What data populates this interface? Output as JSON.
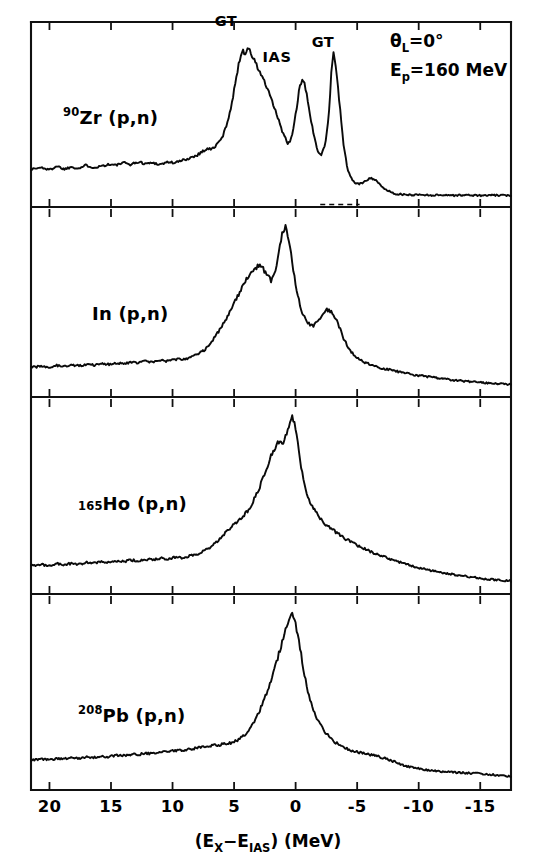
{
  "figure": {
    "kind": "multi-panel-spectrum",
    "background_color": "#ffffff",
    "ink_color": "#0a0a0a"
  },
  "axis": {
    "x_title_parts": {
      "open": "(E",
      "sub1": "X",
      "minus": "−E",
      "sub2": "IAS",
      "close": ") (MeV)"
    },
    "x_title_plain": "(E_X-E_IAS) (MeV)",
    "x_tick_labels": [
      "20",
      "15",
      "10",
      "5",
      "0",
      "-5",
      "-10",
      "-15"
    ],
    "x_tick_values": [
      20,
      15,
      10,
      5,
      0,
      -5,
      -10,
      -15
    ],
    "x_range": [
      21.5,
      -17.5
    ],
    "x_direction": "decreasing-left-to-right"
  },
  "conditions": {
    "angle_symbol": "θ",
    "angle_sub": "L",
    "angle_value": "=0°",
    "angle_full": "θ_L = 0°",
    "energy_symbol": "E",
    "energy_sub": "p",
    "energy_value": "=160 MeV",
    "energy_full": "E_p = 160 MeV"
  },
  "panels": [
    {
      "id": "zr90",
      "label_iso": "90",
      "label_text": "Zr (p,n)",
      "label_full": "90Zr (p,n)",
      "peak_labels": [
        {
          "text": "GT",
          "x_mev": 4.8
        },
        {
          "text": "IAS",
          "x_mev": 0.6
        },
        {
          "text": "GT",
          "x_mev": -2.9
        }
      ]
    },
    {
      "id": "in",
      "label_iso": "",
      "label_text": "In (p,n)",
      "label_full": "In (p,n)",
      "peak_labels": []
    },
    {
      "id": "ho165",
      "label_iso": "165",
      "label_text": "Ho (p,n)",
      "label_full": "165Ho (p,n)",
      "peak_labels": []
    },
    {
      "id": "pb208",
      "label_iso": "208",
      "label_text": "Pb (p,n)",
      "label_full": "208Pb (p,n)",
      "peak_labels": []
    }
  ],
  "chart_data": {
    "type": "line",
    "title": "",
    "xlabel": "(E_X - E_IAS) (MeV)",
    "ylabel": "",
    "xlim": [
      21.5,
      -17.5
    ],
    "grid": false,
    "legend": "none",
    "series": [
      {
        "name": "90Zr (p,n)",
        "x": [
          21.5,
          20.6,
          20.0,
          19.4,
          18.8,
          18.2,
          17.6,
          17.0,
          16.4,
          15.8,
          15.2,
          14.6,
          14.0,
          13.4,
          12.8,
          12.2,
          11.6,
          11.0,
          10.4,
          9.8,
          9.2,
          8.6,
          8.0,
          7.6,
          7.2,
          6.8,
          6.4,
          6.0,
          5.7,
          5.4,
          5.1,
          4.9,
          4.7,
          4.5,
          4.3,
          4.1,
          3.9,
          3.6,
          3.3,
          3.0,
          2.7,
          2.4,
          2.1,
          1.8,
          1.5,
          1.2,
          0.9,
          0.6,
          0.3,
          0.0,
          -0.3,
          -0.6,
          -0.9,
          -1.2,
          -1.5,
          -1.8,
          -2.1,
          -2.4,
          -2.7,
          -2.9,
          -3.1,
          -3.3,
          -3.6,
          -3.9,
          -4.2,
          -4.5,
          -4.8,
          -5.2,
          -5.6,
          -6.0,
          -6.5,
          -7.0,
          -8.0,
          -9.0,
          -10.0,
          -11.0,
          -12.0,
          -13.0,
          -14.0,
          -15.0,
          -16.0,
          -17.5
        ],
        "y": [
          0.175,
          0.185,
          0.17,
          0.195,
          0.175,
          0.19,
          0.18,
          0.2,
          0.185,
          0.195,
          0.205,
          0.2,
          0.215,
          0.205,
          0.22,
          0.21,
          0.215,
          0.205,
          0.22,
          0.215,
          0.23,
          0.245,
          0.265,
          0.285,
          0.305,
          0.3,
          0.33,
          0.37,
          0.43,
          0.52,
          0.62,
          0.72,
          0.81,
          0.88,
          0.93,
          0.905,
          0.945,
          0.9,
          0.855,
          0.8,
          0.76,
          0.7,
          0.64,
          0.58,
          0.51,
          0.44,
          0.38,
          0.33,
          0.38,
          0.52,
          0.68,
          0.74,
          0.66,
          0.5,
          0.38,
          0.29,
          0.27,
          0.33,
          0.52,
          0.78,
          0.93,
          0.8,
          0.56,
          0.33,
          0.18,
          0.12,
          0.09,
          0.08,
          0.095,
          0.12,
          0.11,
          0.06,
          0.02,
          0.012,
          0.014,
          0.01,
          0.012,
          0.009,
          0.011,
          0.008,
          0.01,
          0.008
        ]
      },
      {
        "name": "In (p,n)",
        "x": [
          21.5,
          20.6,
          20.0,
          19.4,
          18.8,
          18.2,
          17.6,
          17.0,
          16.4,
          15.8,
          15.2,
          14.6,
          14.0,
          13.4,
          12.8,
          12.2,
          11.6,
          11.0,
          10.4,
          9.8,
          9.2,
          8.6,
          8.0,
          7.4,
          6.8,
          6.2,
          5.6,
          5.0,
          4.4,
          3.8,
          3.4,
          3.0,
          2.6,
          2.3,
          2.0,
          1.7,
          1.4,
          1.1,
          0.8,
          0.5,
          0.25,
          0.0,
          -0.25,
          -0.5,
          -0.8,
          -1.1,
          -1.5,
          -1.9,
          -2.3,
          -2.7,
          -3.1,
          -3.5,
          -3.9,
          -4.3,
          -4.7,
          -5.1,
          -5.5,
          -6.0,
          -6.5,
          -7.0,
          -7.6,
          -8.2,
          -8.8,
          -9.5,
          -10.2,
          -11.0,
          -12.0,
          -13.0,
          -14.0,
          -15.0,
          -16.0,
          -17.5
        ],
        "y": [
          0.12,
          0.128,
          0.122,
          0.132,
          0.126,
          0.136,
          0.13,
          0.14,
          0.134,
          0.144,
          0.138,
          0.148,
          0.142,
          0.152,
          0.148,
          0.158,
          0.152,
          0.162,
          0.158,
          0.17,
          0.168,
          0.18,
          0.2,
          0.23,
          0.28,
          0.35,
          0.43,
          0.52,
          0.61,
          0.69,
          0.73,
          0.755,
          0.73,
          0.69,
          0.66,
          0.7,
          0.82,
          0.95,
          1.0,
          0.9,
          0.76,
          0.64,
          0.54,
          0.47,
          0.42,
          0.39,
          0.38,
          0.42,
          0.47,
          0.48,
          0.45,
          0.38,
          0.3,
          0.24,
          0.2,
          0.175,
          0.155,
          0.14,
          0.125,
          0.115,
          0.105,
          0.095,
          0.085,
          0.075,
          0.068,
          0.06,
          0.048,
          0.04,
          0.032,
          0.026,
          0.02,
          0.014
        ]
      },
      {
        "name": "165Ho (p,n)",
        "x": [
          21.5,
          20.6,
          20.0,
          19.4,
          18.8,
          18.2,
          17.6,
          17.0,
          16.4,
          15.8,
          15.2,
          14.6,
          14.0,
          13.4,
          12.8,
          12.2,
          11.6,
          11.0,
          10.4,
          9.8,
          9.2,
          8.6,
          8.0,
          7.4,
          6.8,
          6.2,
          5.6,
          5.0,
          4.4,
          3.8,
          3.2,
          2.8,
          2.4,
          2.0,
          1.7,
          1.4,
          1.1,
          0.8,
          0.5,
          0.25,
          0.0,
          -0.25,
          -0.5,
          -0.8,
          -1.2,
          -1.6,
          -2.0,
          -2.5,
          -3.0,
          -3.5,
          -4.0,
          -4.6,
          -5.2,
          -5.8,
          -6.4,
          -7.0,
          -7.7,
          -8.4,
          -9.1,
          -9.8,
          -10.5,
          -11.3,
          -12.1,
          -13.0,
          -14.0,
          -15.0,
          -16.0,
          -17.5
        ],
        "y": [
          0.105,
          0.112,
          0.106,
          0.118,
          0.11,
          0.12,
          0.114,
          0.124,
          0.12,
          0.13,
          0.124,
          0.134,
          0.13,
          0.14,
          0.134,
          0.144,
          0.14,
          0.15,
          0.146,
          0.156,
          0.152,
          0.164,
          0.175,
          0.195,
          0.225,
          0.265,
          0.31,
          0.355,
          0.395,
          0.44,
          0.53,
          0.6,
          0.68,
          0.76,
          0.81,
          0.845,
          0.83,
          0.88,
          0.96,
          1.0,
          0.93,
          0.8,
          0.67,
          0.56,
          0.48,
          0.43,
          0.39,
          0.35,
          0.32,
          0.295,
          0.27,
          0.245,
          0.22,
          0.2,
          0.18,
          0.162,
          0.145,
          0.128,
          0.112,
          0.098,
          0.085,
          0.072,
          0.06,
          0.05,
          0.04,
          0.03,
          0.022,
          0.014
        ]
      },
      {
        "name": "208Pb (p,n)",
        "x": [
          21.5,
          20.6,
          20.0,
          19.4,
          18.8,
          18.2,
          17.6,
          17.0,
          16.4,
          15.8,
          15.2,
          14.6,
          14.0,
          13.4,
          12.8,
          12.2,
          11.6,
          11.0,
          10.4,
          9.8,
          9.2,
          8.6,
          8.0,
          7.4,
          6.8,
          6.2,
          5.6,
          5.0,
          4.5,
          4.0,
          3.5,
          3.0,
          2.6,
          2.2,
          1.8,
          1.5,
          1.2,
          0.9,
          0.6,
          0.3,
          0.0,
          -0.3,
          -0.6,
          -0.9,
          -1.2,
          -1.6,
          -2.0,
          -2.4,
          -2.8,
          -3.2,
          -3.6,
          -4.0,
          -4.5,
          -5.0,
          -5.5,
          -6.0,
          -6.6,
          -7.2,
          -7.8,
          -8.4,
          -9.0,
          -9.8,
          -10.6,
          -11.4,
          -12.2,
          -13.0,
          -14.0,
          -15.0,
          -16.0,
          -17.5
        ],
        "y": [
          0.115,
          0.12,
          0.118,
          0.126,
          0.122,
          0.13,
          0.126,
          0.134,
          0.132,
          0.14,
          0.136,
          0.146,
          0.142,
          0.15,
          0.148,
          0.158,
          0.155,
          0.166,
          0.164,
          0.175,
          0.172,
          0.182,
          0.19,
          0.196,
          0.205,
          0.208,
          0.215,
          0.225,
          0.245,
          0.28,
          0.33,
          0.4,
          0.47,
          0.55,
          0.64,
          0.72,
          0.8,
          0.88,
          0.95,
          0.995,
          0.94,
          0.82,
          0.68,
          0.56,
          0.47,
          0.39,
          0.33,
          0.285,
          0.25,
          0.225,
          0.205,
          0.19,
          0.175,
          0.165,
          0.155,
          0.148,
          0.14,
          0.128,
          0.112,
          0.095,
          0.08,
          0.066,
          0.058,
          0.05,
          0.046,
          0.042,
          0.038,
          0.034,
          0.028,
          0.018
        ]
      }
    ]
  }
}
